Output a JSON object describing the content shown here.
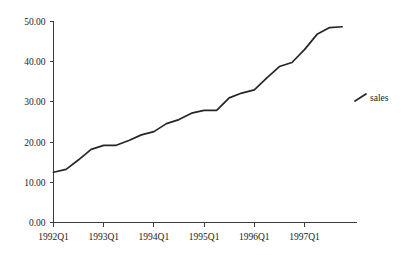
{
  "chart_data": {
    "type": "line",
    "title": "",
    "subtitle": "",
    "xlabel": "",
    "ylabel": "",
    "grid": false,
    "legend_position": "right",
    "xlim": [
      "1992Q1",
      "1997Q4"
    ],
    "ylim": [
      0.0,
      50.0
    ],
    "y_ticks": [
      0.0,
      10.0,
      20.0,
      30.0,
      40.0,
      50.0
    ],
    "y_tick_labels": [
      "0.00",
      "10.00",
      "20.00",
      "30.00",
      "40.00",
      "50.00"
    ],
    "x_ticks": [
      "1992Q1",
      "1993Q1",
      "1994Q1",
      "1995Q1",
      "1996Q1",
      "1997Q1"
    ],
    "x_tick_labels": [
      "1992Q1",
      "1993Q1",
      "1994Q1",
      "1995Q1",
      "1996Q1",
      "1997Q1"
    ],
    "x": [
      "1992Q1",
      "1992Q2",
      "1992Q3",
      "1992Q4",
      "1993Q1",
      "1993Q2",
      "1993Q3",
      "1993Q4",
      "1994Q1",
      "1994Q2",
      "1994Q3",
      "1994Q4",
      "1995Q1",
      "1995Q2",
      "1995Q3",
      "1995Q4",
      "1996Q1",
      "1996Q2",
      "1996Q3",
      "1996Q4",
      "1997Q1",
      "1997Q2",
      "1997Q3",
      "1997Q4"
    ],
    "series": [
      {
        "name": "sales",
        "color": "#262626",
        "values": [
          12.5,
          13.2,
          15.6,
          18.2,
          19.2,
          19.2,
          20.4,
          21.8,
          22.6,
          24.6,
          25.6,
          27.2,
          27.9,
          27.9,
          31.0,
          32.2,
          33.0,
          36.0,
          38.8,
          39.8,
          43.0,
          46.8,
          48.5,
          48.7
        ]
      }
    ],
    "legend": [
      {
        "label": "sales",
        "color": "#262626"
      }
    ],
    "annotations": []
  },
  "legend": {
    "series_label": "sales"
  },
  "axes": {
    "y_labels": [
      "50.00",
      "40.00",
      "30.00",
      "20.00",
      "10.00",
      "0.00"
    ],
    "x_labels": [
      "1992Q1",
      "1993Q1",
      "1994Q1",
      "1995Q1",
      "1996Q1",
      "1997Q1"
    ]
  }
}
